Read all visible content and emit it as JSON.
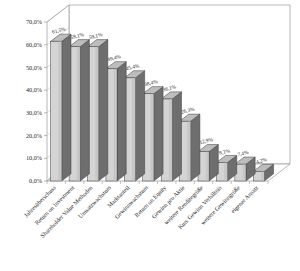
{
  "chart_data": {
    "type": "bar",
    "title": "",
    "subtitle": "",
    "xlabel": "",
    "ylabel": "",
    "ylim": [
      0,
      70
    ],
    "grid": false,
    "legend": "none",
    "three_d": true,
    "categories": [
      "Jahresüberschuss",
      "Return on Investment",
      "Shareholder Value Methoden",
      "Umsatzwachstum",
      "Marktanteil",
      "Gewinnwachstum",
      "Return on Equity",
      "Gewinn pro Aktie",
      "weitere Renditegröße",
      "Kurs Gewinn Verhältnis",
      "weitere Gewinngröße",
      "eigener Ansatz"
    ],
    "values": [
      61.5,
      59.1,
      59.1,
      49.4,
      45.4,
      38.4,
      36.1,
      26.3,
      12.9,
      8.1,
      7.4,
      4.2
    ],
    "value_labels": [
      "61,5%",
      "59,1%",
      "59,1%",
      "49,4%",
      "45,4%",
      "38,4%",
      "36,1%",
      "26,3%",
      "12,9%",
      "8,1%",
      "7,4%",
      "4,2%"
    ],
    "ytick_values": [
      0,
      10,
      20,
      30,
      40,
      50,
      60,
      70
    ],
    "ytick_labels": [
      "0,0%",
      "10,0%",
      "20,0%",
      "30,0%",
      "40,0%",
      "50,0%",
      "60,0%",
      "70,0%"
    ],
    "colors": {
      "bar_front": "#d4d4d4",
      "bar_side": "#6e6e6e",
      "bar_top": "#bdbdbd",
      "bar_edge": "#3a3a3a",
      "axis": "#9a9a9a",
      "text": "#1a1a1a",
      "background": "#ffffff"
    }
  }
}
